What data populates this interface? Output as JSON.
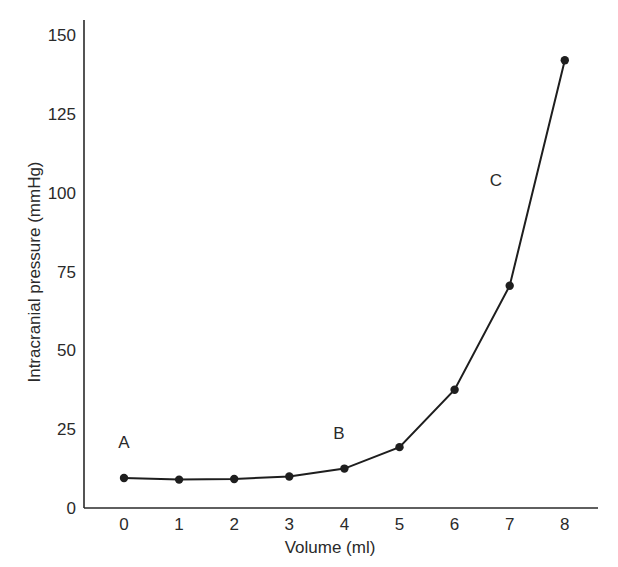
{
  "chart_data": {
    "type": "line",
    "title": "",
    "xlabel": "Volume (ml)",
    "ylabel": "Intracranial pressure (mmHg)",
    "x": [
      0,
      1,
      2,
      3,
      4,
      5,
      6,
      7,
      8
    ],
    "series": [
      {
        "name": "Intracranial pressure",
        "values": [
          9.5,
          9,
          9.2,
          10,
          12.5,
          19.3,
          37.5,
          70.5,
          142
        ]
      }
    ],
    "xticks": [
      "0",
      "1",
      "2",
      "3",
      "4",
      "5",
      "6",
      "7",
      "8"
    ],
    "yticks": [
      "0",
      "25",
      "50",
      "75",
      "100",
      "125",
      "150"
    ],
    "xlim": [
      -0.6,
      8.6
    ],
    "ylim": [
      0,
      150
    ],
    "grid": false,
    "legend": null,
    "annotations": [
      {
        "text": "A",
        "x": 0,
        "y": 19
      },
      {
        "text": "B",
        "x": 3.9,
        "y": 22
      },
      {
        "text": "C",
        "x": 6.75,
        "y": 102
      }
    ]
  },
  "colors": {
    "line": "#1e1e1e",
    "axis": "#2a2a2a",
    "text": "#2a2a2a"
  }
}
